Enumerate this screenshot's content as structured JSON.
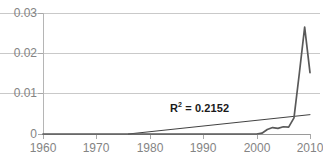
{
  "chart_data": {
    "type": "line",
    "title": "",
    "xlabel": "",
    "ylabel": "",
    "xlim": [
      1960,
      2010
    ],
    "ylim": [
      0,
      0.03
    ],
    "grid": true,
    "legend": "none",
    "xticks": [
      "1960",
      "1970",
      "1980",
      "1990",
      "2000",
      "2010"
    ],
    "xtick_values": [
      1960,
      1970,
      1980,
      1990,
      2000,
      2010
    ],
    "yticks": [
      "0",
      "0.01",
      "0.02",
      "0.03"
    ],
    "ytick_values": [
      0,
      0.01,
      0.02,
      0.03
    ],
    "annotations": [
      {
        "text": "R² = 0.2152",
        "base": "R",
        "sup": "2",
        "rest": " = 0.2152",
        "x": 1992,
        "y": 0.0075
      }
    ],
    "series": [
      {
        "name": "data",
        "color": "#595959",
        "x": [
          1960,
          1965,
          1970,
          1975,
          1980,
          1985,
          1990,
          1995,
          1998,
          2000,
          2001,
          2002,
          2003,
          2004,
          2005,
          2006,
          2007,
          2008,
          2009,
          2010
        ],
        "values": [
          0,
          0,
          0,
          0,
          0,
          0,
          0,
          0,
          0,
          0,
          0.0002,
          0.0011,
          0.0016,
          0.0014,
          0.0018,
          0.0017,
          0.004,
          0.015,
          0.0265,
          0.0152
        ]
      },
      {
        "name": "trendline",
        "color": "#2b2b2b",
        "x": [
          1976,
          2010
        ],
        "values": [
          0,
          0.0048
        ]
      }
    ]
  }
}
